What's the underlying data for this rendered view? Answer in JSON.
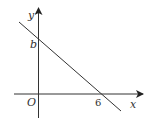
{
  "diagram": {
    "type": "coordinate-graph",
    "axes": {
      "x_label": "x",
      "y_label": "y",
      "origin_label": "O"
    },
    "line": {
      "y_intercept_label": "b",
      "x_intercept_label": "6",
      "slope_sign": "negative"
    },
    "colors": {
      "stroke": "#333333",
      "background": "#ffffff"
    }
  }
}
